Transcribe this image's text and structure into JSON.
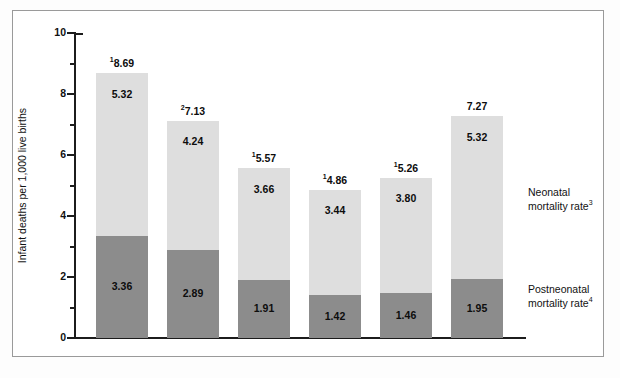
{
  "chart_data": {
    "type": "bar",
    "stacked": true,
    "title": "",
    "subtitle": "",
    "xlabel": "",
    "ylabel": "Infant deaths per 1,000 live births",
    "ylim": [
      0,
      10
    ],
    "yticks": [
      0,
      2,
      4,
      6,
      8,
      10
    ],
    "ytick_labels": [
      "0",
      "2",
      "4",
      "6",
      "8",
      "10"
    ],
    "yminor_ticks": [
      1,
      3,
      5,
      7,
      9
    ],
    "grid": false,
    "legend_position": "right",
    "categories": [
      "Under 20",
      "20–24",
      "25–29",
      "30–34",
      "35–39",
      "40 and over"
    ],
    "series": [
      {
        "name": "Neonatal mortality rate",
        "footnote_marker": "3",
        "color": "#dedede",
        "values": [
          5.32,
          4.24,
          3.66,
          3.44,
          3.8,
          5.32
        ]
      },
      {
        "name": "Postneonatal mortality rate",
        "footnote_marker": "4",
        "color": "#8c8c8c",
        "values": [
          3.36,
          2.89,
          1.91,
          1.42,
          1.46,
          1.95
        ]
      }
    ],
    "totals": [
      8.69,
      7.13,
      5.57,
      4.86,
      5.26,
      7.27
    ],
    "total_labels": [
      "8.69",
      "7.13",
      "5.57",
      "4.86",
      "5.26",
      "7.27"
    ],
    "total_footnote_markers": [
      "1",
      "2",
      "1",
      "1",
      "1",
      ""
    ]
  },
  "axis": {
    "y_title": "Infant deaths per 1,000 live births",
    "y_labels": [
      "10",
      "8",
      "6",
      "4",
      "2",
      "0"
    ]
  },
  "bars": [
    {
      "category": "Under 20",
      "total_label": "8.69",
      "total_marker": "1",
      "neonatal_label": "5.32",
      "postneonatal_label": "3.36",
      "neonatal_value": 5.32,
      "postneonatal_value": 3.36,
      "total_value": 8.69
    },
    {
      "category": "20–24",
      "total_label": "7.13",
      "total_marker": "2",
      "neonatal_label": "4.24",
      "postneonatal_label": "2.89",
      "neonatal_value": 4.24,
      "postneonatal_value": 2.89,
      "total_value": 7.13
    },
    {
      "category": "25–29",
      "total_label": "5.57",
      "total_marker": "1",
      "neonatal_label": "3.66",
      "postneonatal_label": "1.91",
      "neonatal_value": 3.66,
      "postneonatal_value": 1.91,
      "total_value": 5.57
    },
    {
      "category": "30–34",
      "total_label": "4.86",
      "total_marker": "1",
      "neonatal_label": "3.44",
      "postneonatal_label": "1.42",
      "neonatal_value": 3.44,
      "postneonatal_value": 1.42,
      "total_value": 4.86
    },
    {
      "category": "35–39",
      "total_label": "5.26",
      "total_marker": "1",
      "neonatal_label": "3.80",
      "postneonatal_label": "1.46",
      "neonatal_value": 3.8,
      "postneonatal_value": 1.46,
      "total_value": 5.26
    },
    {
      "category": "40 and over",
      "total_label": "7.27",
      "total_marker": "",
      "neonatal_label": "5.32",
      "postneonatal_label": "1.95",
      "neonatal_value": 5.32,
      "postneonatal_value": 1.95,
      "total_value": 7.27
    }
  ],
  "legend": {
    "neonatal": {
      "line1": "Neonatal",
      "line2": "mortality rate",
      "marker": "3"
    },
    "postneonatal": {
      "line1": "Postneonatal",
      "line2": "mortality rate",
      "marker": "4"
    }
  },
  "colors": {
    "neonatal": "#dedede",
    "postneonatal": "#8c8c8c",
    "axis": "#1c1c1c",
    "frame": "#9a9a9a",
    "text": "#111111",
    "background": "#ffffff"
  }
}
